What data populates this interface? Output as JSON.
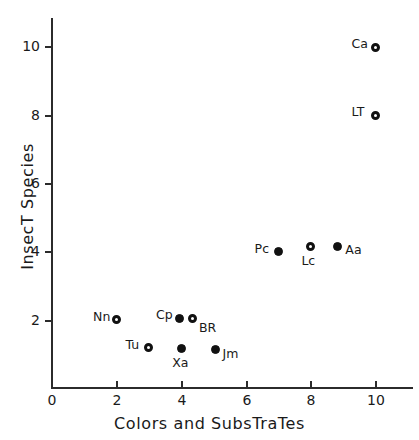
{
  "chart_data": {
    "type": "scatter",
    "title": "",
    "xlabel": "Colors and SubsTraTes",
    "ylabel": "InsecT Species",
    "xlim": [
      0,
      11.2
    ],
    "ylim": [
      0,
      10.9
    ],
    "grid": false,
    "legend": "none",
    "xticks": [
      0,
      2,
      4,
      6,
      8,
      10
    ],
    "xtick_labels": [
      "0",
      "2",
      "4",
      "6",
      "8",
      "10"
    ],
    "yticks": [
      2,
      4,
      6,
      8,
      10
    ],
    "ytick_labels": [
      "2",
      "4",
      "6",
      "8",
      "10"
    ],
    "points": [
      {
        "label": "Ca",
        "x": 10.0,
        "y": 10.0,
        "marker": "open",
        "label_pos": "left"
      },
      {
        "label": "LT",
        "x": 10.0,
        "y": 8.0,
        "marker": "open",
        "label_pos": "left"
      },
      {
        "label": "Pc",
        "x": 7.0,
        "y": 4.0,
        "marker": "filled",
        "label_pos": "left"
      },
      {
        "label": "Lc",
        "x": 8.0,
        "y": 4.15,
        "marker": "open",
        "label_pos": "below"
      },
      {
        "label": "Aa",
        "x": 8.85,
        "y": 4.15,
        "marker": "filled",
        "label_pos": "right"
      },
      {
        "label": "Nn",
        "x": 2.0,
        "y": 2.0,
        "marker": "open",
        "label_pos": "left"
      },
      {
        "label": "Cp",
        "x": 3.95,
        "y": 2.05,
        "marker": "filled",
        "label_pos": "left"
      },
      {
        "label": "BR",
        "x": 4.35,
        "y": 2.05,
        "marker": "open",
        "label_pos": "right-below"
      },
      {
        "label": "Tu",
        "x": 3.0,
        "y": 1.18,
        "marker": "open",
        "label_pos": "left"
      },
      {
        "label": "Xa",
        "x": 4.0,
        "y": 1.15,
        "marker": "filled",
        "label_pos": "below"
      },
      {
        "label": "Jm",
        "x": 5.05,
        "y": 1.12,
        "marker": "filled",
        "label_pos": "right"
      }
    ]
  }
}
